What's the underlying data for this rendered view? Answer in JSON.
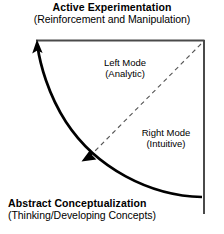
{
  "diagram": {
    "top_axis": {
      "heading": "Active Experimentation",
      "subtitle": "(Reinforcement and Manipulation)"
    },
    "bottom_axis": {
      "heading": "Abstract Conceptualization",
      "subtitle": "(Thinking/Developing Concepts)"
    },
    "quadrants": [
      {
        "heading": "Left Mode",
        "subtitle": "(Analytic)"
      },
      {
        "heading": "Right Mode",
        "subtitle": "(Intuitive)"
      }
    ],
    "graphics": {
      "frame_label": "right-angle frame",
      "arc_label": "curved flow arrow",
      "diagonal_label": "dashed mode divider",
      "arrow_tip_label": "arrowhead",
      "arrow_mid_label": "mid-arc arrowhead"
    },
    "colors": {
      "ink": "#000000",
      "frame": "#4a4a4a",
      "dashed": "#555555",
      "background": "#ffffff"
    }
  }
}
